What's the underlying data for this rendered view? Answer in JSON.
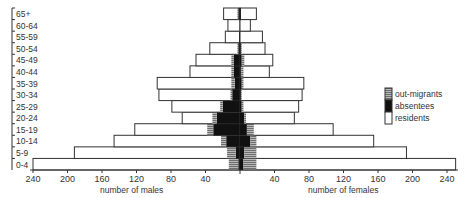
{
  "chart_data": {
    "type": "bar",
    "subtype": "population-pyramid",
    "title": "",
    "categories": [
      "0-4",
      "5-9",
      "10-14",
      "15-19",
      "20-24",
      "25-29",
      "30-34",
      "35-39",
      "40-44",
      "45-49",
      "50-54",
      "55-59",
      "60-64",
      "65+"
    ],
    "xlabel_left": "number of males",
    "xlabel_right": "number of females",
    "x_ticks_left": [
      "240",
      "200",
      "160",
      "120",
      "80",
      "40"
    ],
    "x_ticks_right": [
      "40",
      "80",
      "120",
      "160",
      "200",
      "240"
    ],
    "x_tick_values": [
      40,
      80,
      120,
      160,
      200,
      240
    ],
    "xlim": [
      0,
      240
    ],
    "legend": {
      "placement": "right",
      "entries": [
        {
          "key": "out_migrants",
          "label": "out-migrants"
        },
        {
          "key": "absentees",
          "label": "absentees"
        },
        {
          "key": "residents",
          "label": "residents"
        }
      ]
    },
    "series": {
      "males": {
        "total": [
          240,
          192,
          146,
          122,
          67,
          79,
          94,
          96,
          58,
          51,
          35,
          17,
          14,
          19
        ],
        "absentees": [
          2,
          5,
          16,
          31,
          27,
          20,
          9,
          6,
          7,
          7,
          2,
          1,
          0,
          2
        ],
        "out_migrants": [
          11,
          10,
          6,
          7,
          5,
          3,
          2,
          4,
          3,
          3,
          1,
          0,
          0,
          1
        ]
      },
      "females": {
        "total": [
          250,
          193,
          155,
          108,
          63,
          68,
          72,
          74,
          34,
          38,
          29,
          26,
          12,
          19
        ],
        "absentees": [
          4,
          5,
          12,
          8,
          5,
          2,
          1,
          2,
          1,
          2,
          1,
          0,
          0,
          1
        ],
        "out_migrants": [
          15,
          14,
          7,
          8,
          2,
          2,
          1,
          2,
          3,
          3,
          1,
          0,
          0,
          0
        ]
      }
    },
    "colors": {
      "residents": "#ffffff",
      "absentees": "#111111",
      "out_migrants": "#9a9a9a",
      "stroke": "#333333"
    }
  }
}
